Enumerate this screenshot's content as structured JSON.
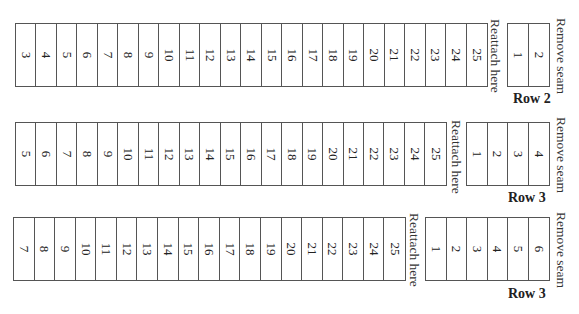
{
  "sections": [
    {
      "row_label": "Row 2",
      "reattach_label": "Reattach here",
      "remove_label": "Remove seam",
      "main_cells": [
        "3",
        "4",
        "5",
        "6",
        "7",
        "8",
        "9",
        "10",
        "11",
        "12",
        "13",
        "14",
        "15",
        "16",
        "17",
        "18",
        "19",
        "20",
        "21",
        "22",
        "23",
        "24",
        "25"
      ],
      "seam_cells": [
        "1",
        "2"
      ]
    },
    {
      "row_label": "Row 3",
      "reattach_label": "Reattach here",
      "remove_label": "Remove seam",
      "main_cells": [
        "5",
        "6",
        "7",
        "8",
        "9",
        "10",
        "11",
        "12",
        "13",
        "14",
        "15",
        "16",
        "17",
        "18",
        "19",
        "20",
        "21",
        "22",
        "23",
        "24",
        "25"
      ],
      "seam_cells": [
        "1",
        "2",
        "3",
        "4"
      ]
    },
    {
      "row_label": "Row 3",
      "reattach_label": "Reattach here",
      "remove_label": "Remove seam",
      "main_cells": [
        "7",
        "8",
        "9",
        "10",
        "11",
        "12",
        "13",
        "14",
        "15",
        "16",
        "17",
        "18",
        "19",
        "20",
        "21",
        "22",
        "23",
        "24",
        "25"
      ],
      "seam_cells": [
        "1",
        "2",
        "3",
        "4",
        "5",
        "6"
      ]
    }
  ]
}
